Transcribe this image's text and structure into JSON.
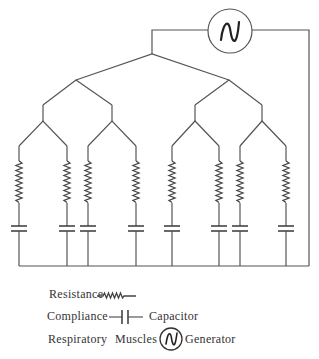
{
  "diagram": {
    "generator": {
      "label": "Respiratory Muscles Generator",
      "icon": "sine-wave-in-circle"
    },
    "branches": 8,
    "colors": {
      "line": "#555555",
      "text": "#333333",
      "background": "#ffffff"
    }
  },
  "legend": {
    "resistance": {
      "label": "Resistance",
      "symbol": "zigzag-resistor"
    },
    "compliance": {
      "label": "Compliance",
      "symbol_label": "Capacitor",
      "symbol": "capacitor"
    },
    "generator": {
      "label_1": "Respiratory",
      "label_2": "Muscles",
      "symbol_label": "Generator",
      "symbol": "sine-generator"
    }
  }
}
